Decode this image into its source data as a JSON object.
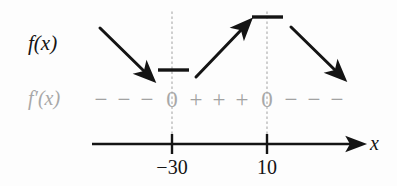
{
  "figure": {
    "type": "sign-chart",
    "title": "",
    "background_color": "#fdfdfd",
    "ink_color": "#141414",
    "muted_color": "#a2a2a2",
    "labels": {
      "function_label": "f(x)",
      "derivative_label": "f′(x)",
      "axis_label": "x"
    },
    "axis": {
      "orientation": "horizontal",
      "arrow_end": "right",
      "ticks": [
        {
          "label": "−30",
          "value": -30,
          "x_px": 172
        },
        {
          "label": "10",
          "value": 10,
          "x_px": 267
        }
      ]
    },
    "critical_points": [
      {
        "label": "0",
        "at_tick": "−30",
        "x_px": 172
      },
      {
        "label": "0",
        "at_tick": "10",
        "x_px": 267
      }
    ],
    "sign_row": {
      "name": "f'(x)",
      "symbols": [
        {
          "glyph": "−",
          "x_px": 101
        },
        {
          "glyph": "−",
          "x_px": 124
        },
        {
          "glyph": "−",
          "x_px": 147
        },
        {
          "glyph": "0",
          "x_px": 172
        },
        {
          "glyph": "+",
          "x_px": 196
        },
        {
          "glyph": "+",
          "x_px": 219
        },
        {
          "glyph": "+",
          "x_px": 242
        },
        {
          "glyph": "0",
          "x_px": 267
        },
        {
          "glyph": "−",
          "x_px": 291
        },
        {
          "glyph": "−",
          "x_px": 314
        },
        {
          "glyph": "−",
          "x_px": 337
        }
      ]
    },
    "intervals": [
      {
        "range": "x < −30",
        "derivative_sign": "−",
        "behavior": "decreasing",
        "arrow": "down-right"
      },
      {
        "range": "−30 < x < 10",
        "derivative_sign": "+",
        "behavior": "increasing",
        "arrow": "up-right"
      },
      {
        "range": "x > 10",
        "derivative_sign": "−",
        "behavior": "decreasing",
        "arrow": "down-right"
      }
    ],
    "extrema": [
      {
        "kind": "local-minimum",
        "at": "−30",
        "marker": "horizontal-dash",
        "x_px": 173,
        "y_px": 70
      },
      {
        "kind": "local-maximum",
        "at": "10",
        "marker": "horizontal-dash",
        "x_px": 267,
        "y_px": 17
      }
    ]
  }
}
